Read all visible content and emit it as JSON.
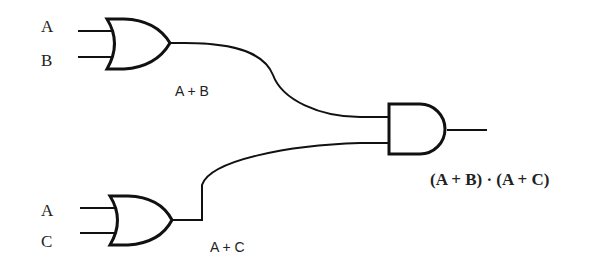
{
  "diagram": {
    "gates": [
      {
        "id": "or1",
        "type": "OR",
        "inputs": [
          "A",
          "B"
        ],
        "output_label": "A + B"
      },
      {
        "id": "or2",
        "type": "OR",
        "inputs": [
          "A",
          "C"
        ],
        "output_label": "A + C"
      },
      {
        "id": "and1",
        "type": "AND",
        "inputs": [
          "A + B",
          "A + C"
        ],
        "output_label": "(A + B) · (A + C)"
      }
    ],
    "labels": {
      "or1_in1": "A",
      "or1_in2": "B",
      "or1_out": "A + B",
      "or2_in1": "A",
      "or2_in2": "C",
      "or2_out": "A + C",
      "final_out": "(A + B) · (A + C)"
    },
    "colors": {
      "stroke": "#111111",
      "background": "#ffffff"
    }
  }
}
